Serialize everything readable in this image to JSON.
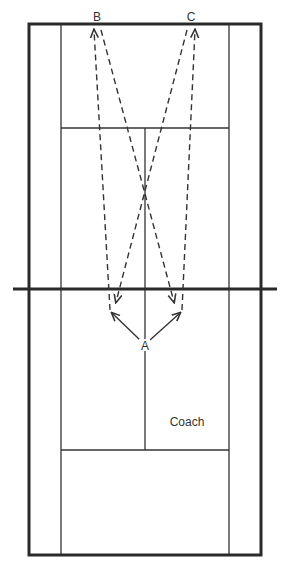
{
  "diagram": {
    "type": "tennis-court-drill",
    "colors": {
      "line": "#333333",
      "outer_line": "#2a2a2a",
      "background": "#ffffff"
    },
    "court": {
      "outer": {
        "x1": 29,
        "y1": 24,
        "x2": 261,
        "y2": 555
      },
      "singles_left_x": 61,
      "singles_right_x": 229,
      "top_service_line_y": 128,
      "bottom_service_line_y": 450,
      "center_line_x": 145,
      "net": {
        "y": 289,
        "x1": 13,
        "x2": 277
      }
    },
    "labels": {
      "player_b": "B",
      "player_c": "C",
      "player_a": "A",
      "coach": "Coach"
    },
    "shots": {
      "solid": [
        {
          "from": "A",
          "to": "left-target"
        },
        {
          "from": "A",
          "to": "right-target"
        }
      ],
      "dashed": [
        {
          "from": "left-target",
          "to": "B"
        },
        {
          "from": "B",
          "to": "right-net"
        },
        {
          "from": "C",
          "to": "left-net"
        },
        {
          "from": "right-target",
          "to": "C"
        }
      ]
    }
  }
}
